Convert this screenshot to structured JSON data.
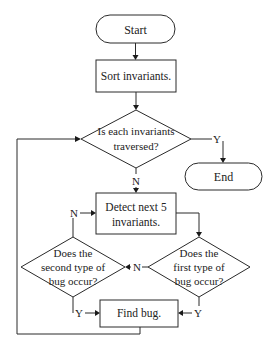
{
  "diagram": {
    "type": "flowchart",
    "nodes": {
      "start": {
        "label": "Start",
        "shape": "terminator"
      },
      "sort": {
        "label": "Sort invariants.",
        "shape": "process"
      },
      "traversed": {
        "lines": [
          "Is each invariants",
          "traversed?"
        ],
        "shape": "decision"
      },
      "end": {
        "label": "End",
        "shape": "terminator"
      },
      "detect": {
        "lines": [
          "Detect next 5",
          "invariants."
        ],
        "shape": "process"
      },
      "second_bug": {
        "lines": [
          "Does the",
          "second type of",
          "bug occur?"
        ],
        "shape": "decision"
      },
      "first_bug": {
        "lines": [
          "Does the",
          "first type of",
          "bug occur?"
        ],
        "shape": "decision"
      },
      "find_bug": {
        "label": "Find bug.",
        "shape": "process"
      }
    },
    "edge_labels": {
      "traversed_yes": "Y",
      "traversed_no": "N",
      "second_no": "N",
      "first_no": "N",
      "second_yes": "Y",
      "first_yes": "Y"
    },
    "edges": [
      {
        "from": "Start",
        "to": "Sort invariants."
      },
      {
        "from": "Sort invariants.",
        "to": "Is each invariants traversed?"
      },
      {
        "from": "Is each invariants traversed?",
        "to": "End",
        "label": "Y"
      },
      {
        "from": "Is each invariants traversed?",
        "to": "Detect next 5 invariants.",
        "label": "N"
      },
      {
        "from": "Detect next 5 invariants.",
        "to": "Does the first type of bug occur?"
      },
      {
        "from": "Does the first type of bug occur?",
        "to": "Does the second type of bug occur?",
        "label": "N"
      },
      {
        "from": "Does the second type of bug occur?",
        "to": "Detect next 5 invariants.",
        "label": "N"
      },
      {
        "from": "Does the first type of bug occur?",
        "to": "Find bug.",
        "label": "Y"
      },
      {
        "from": "Does the second type of bug occur?",
        "to": "Find bug.",
        "label": "Y"
      },
      {
        "from": "Find bug.",
        "to": "Is each invariants traversed?"
      }
    ]
  }
}
